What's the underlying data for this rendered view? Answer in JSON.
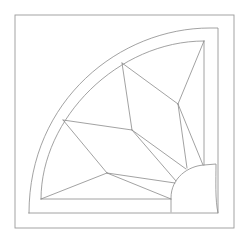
{
  "diagram": {
    "title": "",
    "stroke_color": "#8a8a8a",
    "background": "#ffffff",
    "outer_square": {
      "x1": 15,
      "y1": 15,
      "x2": 234,
      "y2": 228
    },
    "outer_arc_frame": {
      "corner": [
        218,
        213
      ],
      "top": [
        88,
        28
      ],
      "top_right": [
        218,
        28
      ],
      "bottom_left": [
        29,
        213
      ],
      "left": [
        29,
        84
      ]
    },
    "inner_arc": {
      "top_right": [
        204,
        41
      ],
      "bottom_left": [
        41,
        199
      ]
    },
    "vertices": {
      "arc_top": [
        122,
        63
      ],
      "arc_left": [
        63,
        120
      ],
      "center": [
        132,
        130
      ],
      "upper_right": [
        178,
        104
      ],
      "lower_left": [
        107,
        173
      ]
    },
    "small_quarter_circle": {
      "base_left": [
        171,
        212
      ],
      "top": [
        218,
        164
      ]
    }
  }
}
